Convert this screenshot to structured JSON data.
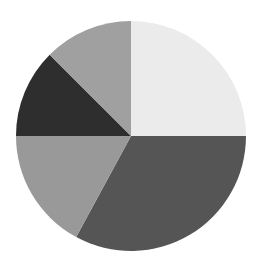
{
  "chart_data": {
    "type": "pie",
    "title": "",
    "legend": null,
    "start_angle_deg": -90,
    "direction": "clockwise",
    "center": [
      131,
      136
    ],
    "radius": 115,
    "categories": [
      "Slice A",
      "Slice B",
      "Slice C",
      "Slice D",
      "Slice E"
    ],
    "values": [
      25.0,
      32.9,
      17.1,
      12.5,
      12.5
    ],
    "colors": [
      "#ebebeb",
      "#555555",
      "#999999",
      "#2e2e2e",
      "#a0a0a0"
    ],
    "labels_visible": false
  }
}
